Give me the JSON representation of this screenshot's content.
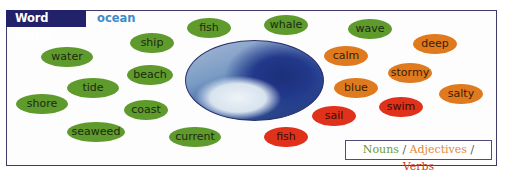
{
  "header": {
    "title": "Word World",
    "topic": "ocean"
  },
  "colors": {
    "noun": "#5e9a2c",
    "adjective": "#e07a1e",
    "verb": "#e0321b",
    "header_bg": "#22226a",
    "topic": "#3f8ac9"
  },
  "image": {
    "description": "ocean wave"
  },
  "words": [
    {
      "text": "fish",
      "type": "noun",
      "x": 209,
      "y": 28,
      "w": 44
    },
    {
      "text": "whale",
      "type": "noun",
      "x": 286,
      "y": 25,
      "w": 44
    },
    {
      "text": "wave",
      "type": "noun",
      "x": 370,
      "y": 29,
      "w": 44
    },
    {
      "text": "ship",
      "type": "noun",
      "x": 152,
      "y": 43,
      "w": 44
    },
    {
      "text": "water",
      "type": "noun",
      "x": 67,
      "y": 57,
      "w": 52
    },
    {
      "text": "beach",
      "type": "noun",
      "x": 150,
      "y": 75,
      "w": 46
    },
    {
      "text": "tide",
      "type": "noun",
      "x": 93,
      "y": 88,
      "w": 52
    },
    {
      "text": "shore",
      "type": "noun",
      "x": 42,
      "y": 104,
      "w": 52
    },
    {
      "text": "coast",
      "type": "noun",
      "x": 146,
      "y": 110,
      "w": 44
    },
    {
      "text": "seaweed",
      "type": "noun",
      "x": 96,
      "y": 132,
      "w": 58
    },
    {
      "text": "current",
      "type": "noun",
      "x": 195,
      "y": 137,
      "w": 52
    },
    {
      "text": "calm",
      "type": "adj",
      "x": 346,
      "y": 56,
      "w": 44
    },
    {
      "text": "deep",
      "type": "adj",
      "x": 435,
      "y": 44,
      "w": 44
    },
    {
      "text": "stormy",
      "type": "adj",
      "x": 410,
      "y": 73,
      "w": 44
    },
    {
      "text": "blue",
      "type": "adj",
      "x": 356,
      "y": 88,
      "w": 44
    },
    {
      "text": "salty",
      "type": "adj",
      "x": 461,
      "y": 94,
      "w": 44
    },
    {
      "text": "swim",
      "type": "verb",
      "x": 401,
      "y": 107,
      "w": 44
    },
    {
      "text": "sail",
      "type": "verb",
      "x": 334,
      "y": 116,
      "w": 44
    },
    {
      "text": "fish",
      "type": "verb",
      "x": 286,
      "y": 137,
      "w": 44
    }
  ],
  "legend": {
    "nouns": "Nouns",
    "adjectives": "Adjectives",
    "verbs": "Verbs",
    "separator": "/"
  }
}
